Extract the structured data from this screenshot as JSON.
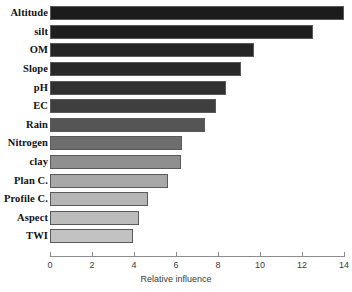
{
  "chart_data": {
    "type": "bar",
    "orientation": "horizontal",
    "title": "",
    "xlabel": "Relative influence",
    "ylabel": "",
    "categories": [
      "Altitude",
      "silt",
      "OM",
      "Slope",
      "pH",
      "EC",
      "Rain",
      "Nitrogen",
      "clay",
      "Plan C.",
      "Profile C.",
      "Aspect",
      "TWI"
    ],
    "values": [
      14.0,
      12.5,
      9.7,
      9.1,
      8.4,
      7.9,
      7.4,
      6.3,
      6.25,
      5.6,
      4.65,
      4.25,
      3.95
    ],
    "xlim": [
      0,
      14
    ],
    "xticks": [
      0,
      2,
      4,
      6,
      8,
      10,
      12,
      14
    ],
    "xtick_labels": [
      "0",
      "2",
      "4",
      "6",
      "8",
      "10",
      "12",
      "14"
    ],
    "grid": false,
    "legend": "none",
    "bar_colors": [
      "#1c1c1c",
      "#1f1f1f",
      "#252525",
      "#282828",
      "#303030",
      "#3f3f3f",
      "#555555",
      "#6e6e6e",
      "#8f8f8f",
      "#a8a8a8",
      "#b5b5b5",
      "#bcbcbc",
      "#c2c2c2"
    ],
    "bar_border_color": "#5a5a5a",
    "axis_color": "#8c8c8c",
    "background": "#ffffff"
  }
}
